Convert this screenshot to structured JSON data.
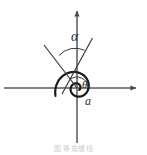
{
  "figure": {
    "width": 147,
    "height": 155,
    "background": "#ffffff",
    "stroke_color": "#1a1a1a",
    "axis_color": "#5a5a5a",
    "label_color": "#2b2b2b",
    "caption_color": "#cfcfcf"
  },
  "labels": {
    "alpha": "α",
    "theta": "θ",
    "radius_a": "a",
    "caption": "图   等角螺线"
  },
  "chart_data": {
    "type": "line",
    "title": "",
    "subtitle": "",
    "xlabel": "",
    "ylabel": "",
    "grid": false,
    "legend": "none",
    "origin_px": [
      77,
      88
    ],
    "xlim": [
      -77,
      70
    ],
    "ylim": [
      -67,
      88
    ],
    "axes": {
      "x_axis": {
        "from_px": [
          4,
          88
        ],
        "to_px": [
          141,
          88
        ],
        "arrow": "right"
      },
      "y_axis": {
        "from_px": [
          77,
          143
        ],
        "to_px": [
          77,
          5
        ],
        "arrow": "up"
      }
    },
    "series": [
      {
        "name": "logarithmic-spiral",
        "equation": "r = a·e^(θ·cotα)",
        "kind": "polar",
        "a": 3.4,
        "cot_alpha": 0.195,
        "theta_start_deg": -40,
        "theta_end_deg": 560,
        "direction": "counterclockwise"
      },
      {
        "name": "radius-vector",
        "kind": "segment",
        "from_px": [
          77,
          88
        ],
        "to_px": [
          44,
          45
        ],
        "extends_beyond_origin": false
      },
      {
        "name": "tangent-line",
        "kind": "segment",
        "from_px": [
          92,
          39
        ],
        "to_px": [
          63,
          93
        ]
      }
    ],
    "annotations": [
      {
        "name": "alpha-angle-arc",
        "text": "α",
        "vertex_px": [
          73,
          63
        ],
        "radius_px": 22,
        "start_deg": 128,
        "end_deg": 62
      },
      {
        "name": "theta-angle-arc",
        "text": "θ",
        "vertex_px": [
          77,
          88
        ],
        "radius_px": 11,
        "start_deg": 0,
        "end_deg": 128
      },
      {
        "name": "radius-label",
        "text": "a",
        "at_px": [
          85,
          95
        ]
      }
    ]
  }
}
